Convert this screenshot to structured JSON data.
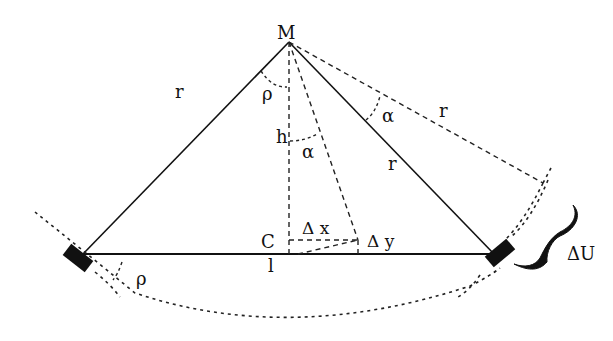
{
  "diagram": {
    "title": "",
    "points": {
      "apex": "M",
      "center": "C"
    },
    "labels": {
      "r_left": "r",
      "r_right": "r",
      "r_dashed": "r",
      "rho_top": "ρ",
      "rho_bottom": "ρ",
      "h": "h",
      "alpha_inner": "α",
      "alpha_outer": "α",
      "l": "l",
      "delta_x": "Δ x",
      "delta_y": "Δ y",
      "delta_u": "ΔU"
    },
    "elements": [
      "suspension-line-left",
      "suspension-line-right",
      "baseline",
      "height-line",
      "rotated-line",
      "rotated-radius",
      "arc-bottom",
      "mass-left",
      "mass-right",
      "brace-delta-u"
    ]
  }
}
